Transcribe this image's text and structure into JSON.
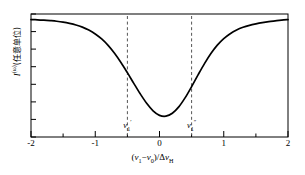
{
  "figure": {
    "background_color": "#ffffff",
    "line_color": "#000000",
    "dash_color": "#555555"
  },
  "chart_data": {
    "type": "line",
    "title": "",
    "xlabel_text": "(v1-v0)/ΔvH",
    "ylabel_text": "I^(ω) (任意单位)",
    "xlabel_parts": {
      "open": "(",
      "nu1": "ν",
      "nu1_sub": "1",
      "minus": "−",
      "nu0": "ν",
      "nu0_sub": "0",
      "close_slash": ")/",
      "delta": "Δ",
      "nu": "ν",
      "nu_sub": "H"
    },
    "ylabel_parts": {
      "symbol": "I",
      "superscript": "(ω)",
      "units": "(任意单位)"
    },
    "xlim": [
      -2,
      2
    ],
    "ylim": [
      0,
      1
    ],
    "xticks": [
      -2,
      -1,
      0,
      1,
      2
    ],
    "xticklabels": [
      "-2",
      "-1",
      "0",
      "1",
      "2"
    ],
    "x_minor_ticks": [
      -1.5,
      -0.5,
      0.5,
      1.5
    ],
    "yticks": [
      0.0,
      0.15,
      0.3,
      0.45,
      0.6,
      0.75,
      0.9
    ],
    "yticklabels": [],
    "grid": false,
    "legend": null,
    "series": [
      {
        "name": "saturated absorption dip profile",
        "x": [
          -2.0,
          -1.9,
          -1.8,
          -1.7,
          -1.6,
          -1.5,
          -1.4,
          -1.3,
          -1.2,
          -1.1,
          -1.0,
          -0.9,
          -0.8,
          -0.7,
          -0.6,
          -0.5,
          -0.4,
          -0.3,
          -0.2,
          -0.1,
          0.0,
          0.1,
          0.2,
          0.3,
          0.4,
          0.5,
          0.6,
          0.7,
          0.8,
          0.9,
          1.0,
          1.1,
          1.2,
          1.3,
          1.4,
          1.5,
          1.6,
          1.7,
          1.8,
          1.9,
          2.0
        ],
        "y": [
          0.955,
          0.953,
          0.95,
          0.946,
          0.941,
          0.934,
          0.924,
          0.911,
          0.893,
          0.869,
          0.838,
          0.797,
          0.745,
          0.681,
          0.606,
          0.523,
          0.436,
          0.351,
          0.274,
          0.213,
          0.176,
          0.169,
          0.193,
          0.245,
          0.32,
          0.41,
          0.505,
          0.597,
          0.679,
          0.747,
          0.8,
          0.84,
          0.87,
          0.892,
          0.908,
          0.92,
          0.93,
          0.938,
          0.944,
          0.95,
          0.955
        ]
      }
    ],
    "annotations": [
      {
        "name": "nu-1-prime",
        "x": -0.5,
        "label_symbol": "ν",
        "label_sub": "1",
        "label_sup": "′",
        "line_style": "dashed",
        "from_y": 0.0,
        "to_y": 1.0
      },
      {
        "name": "nu-1-double-prime",
        "x": 0.5,
        "label_symbol": "ν",
        "label_sub": "1",
        "label_sup": "″",
        "line_style": "dashed",
        "from_y": 0.0,
        "to_y": 1.0
      }
    ]
  }
}
